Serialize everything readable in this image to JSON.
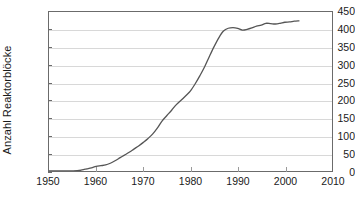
{
  "chart_data": {
    "type": "line",
    "title": "",
    "xlabel": "",
    "ylabel": "Anzahl Reaktorblöcke",
    "xlim": [
      1950,
      2010
    ],
    "ylim": [
      0,
      450
    ],
    "grid": true,
    "legend": null,
    "xticks": [
      1950,
      1960,
      1970,
      1980,
      1990,
      2000,
      2010
    ],
    "yticks": [
      0,
      50,
      100,
      150,
      200,
      250,
      300,
      350,
      400,
      450
    ],
    "line_color": "#555555",
    "gridline_color": "#d8d8d8",
    "axis_color": "#6b6b6b",
    "series": [
      {
        "name": "Anzahl Reaktorblöcke",
        "x": [
          1950,
          1954,
          1956,
          1957,
          1958,
          1959,
          1960,
          1961,
          1962,
          1963,
          1964,
          1965,
          1966,
          1967,
          1968,
          1969,
          1970,
          1971,
          1972,
          1973,
          1974,
          1975,
          1976,
          1977,
          1978,
          1979,
          1980,
          1981,
          1982,
          1983,
          1984,
          1985,
          1986,
          1987,
          1988,
          1989,
          1990,
          1991,
          1992,
          1993,
          1994,
          1995,
          1996,
          1997,
          1998,
          1999,
          2000,
          2001,
          2002,
          2003
        ],
        "values": [
          0,
          0,
          1,
          3,
          6,
          9,
          13,
          15,
          17,
          22,
          29,
          37,
          45,
          53,
          62,
          71,
          81,
          92,
          105,
          122,
          142,
          157,
          172,
          188,
          200,
          213,
          227,
          247,
          270,
          295,
          324,
          352,
          377,
          396,
          404,
          406,
          404,
          399,
          401,
          405,
          410,
          413,
          418,
          417,
          416,
          418,
          421,
          422,
          424,
          425
        ]
      }
    ]
  }
}
